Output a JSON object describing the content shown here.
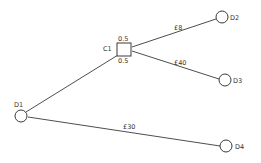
{
  "diagram": {
    "type": "decision-tree",
    "colors": {
      "stroke": "#3a3a3a",
      "text": "#333333",
      "background": "#ffffff"
    },
    "nodes": [
      {
        "id": "D1",
        "label": "D1",
        "shape": "circle",
        "cx": 21,
        "cy": 116,
        "r": 6,
        "label_x": 14,
        "label_y": 107
      },
      {
        "id": "C1",
        "label": "C1",
        "shape": "square",
        "x": 117,
        "y": 43,
        "w": 14,
        "h": 13,
        "label_x": 103,
        "label_y": 51
      },
      {
        "id": "D2",
        "label": "D2",
        "shape": "circle",
        "cx": 222,
        "cy": 17,
        "r": 6,
        "label_x": 230,
        "label_y": 20
      },
      {
        "id": "D3",
        "label": "D3",
        "shape": "circle",
        "cx": 225,
        "cy": 80,
        "r": 6,
        "label_x": 233,
        "label_y": 83
      },
      {
        "id": "D4",
        "label": "D4",
        "shape": "circle",
        "cx": 226,
        "cy": 146,
        "r": 6,
        "label_x": 235,
        "label_y": 149
      }
    ],
    "probabilities": [
      {
        "label": "0.5",
        "x": 118,
        "y": 41
      },
      {
        "label": "0.5",
        "x": 118,
        "y": 63
      }
    ],
    "edges": [
      {
        "from": "D1",
        "to": "C1",
        "x1": 26,
        "y1": 112,
        "x2": 118,
        "y2": 55,
        "label": ""
      },
      {
        "from": "C1",
        "to": "D2",
        "x1": 132,
        "y1": 47,
        "x2": 216,
        "y2": 19,
        "label": "£8",
        "label_x": 174,
        "label_y": 30
      },
      {
        "from": "C1",
        "to": "D3",
        "x1": 132,
        "y1": 51,
        "x2": 219,
        "y2": 79,
        "label": "£40",
        "label_x": 174,
        "label_y": 65
      },
      {
        "from": "D1",
        "to": "D4",
        "x1": 28,
        "y1": 117,
        "x2": 220,
        "y2": 146,
        "label": "£30",
        "label_x": 123,
        "label_y": 129
      }
    ]
  }
}
